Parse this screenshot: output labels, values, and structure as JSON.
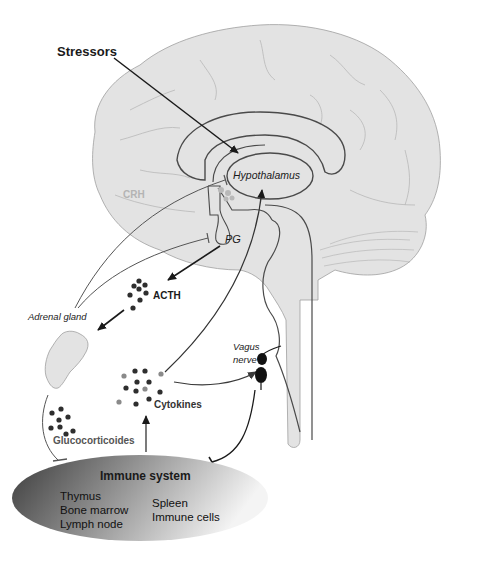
{
  "diagram": {
    "labels": {
      "stressors": "Stressors",
      "hypothalamus": "Hypothalamus",
      "crh": "CRH",
      "pg": "PG",
      "acth": "ACTH",
      "adrenal_gland": "Adrenal gland",
      "vagus_nerve_line1": "Vagus",
      "vagus_nerve_line2": "nerve",
      "cytokines": "Cytokines",
      "glucocorticoides": "Glucocorticoides"
    },
    "immune_system": {
      "title": "Immune system",
      "column1": [
        "Thymus",
        "Bone marrow",
        "Lymph node"
      ],
      "column2": [
        "Spleen",
        "Immune cells"
      ]
    },
    "colors": {
      "brain_fill": "#e3e3e3",
      "brain_outline": "#9a9a9a",
      "structure_line": "#4a4a4a",
      "arrow": "#1a1a1a",
      "dot_dark": "#2e2e2e",
      "dot_light": "#8a8a8a",
      "crh_text": "#b4b4b4",
      "immune_dark": "#3a3a3a",
      "immune_light": "#f2f2f2"
    },
    "relations": [
      {
        "from": "Stressors",
        "to": "Hypothalamus",
        "type": "stimulate"
      },
      {
        "from": "Hypothalamus",
        "to": "PG",
        "via": "CRH",
        "type": "stimulate"
      },
      {
        "from": "PG",
        "to": "ACTH",
        "type": "release"
      },
      {
        "from": "ACTH",
        "to": "Adrenal gland",
        "type": "stimulate"
      },
      {
        "from": "Adrenal gland",
        "to": "Hypothalamus",
        "type": "inhibit"
      },
      {
        "from": "Adrenal gland",
        "to": "PG",
        "type": "inhibit"
      },
      {
        "from": "Adrenal gland",
        "to": "Immune system",
        "via": "Glucocorticoides",
        "type": "inhibit"
      },
      {
        "from": "Immune system",
        "to": "Cytokines",
        "type": "release"
      },
      {
        "from": "Cytokines",
        "to": "Hypothalamus",
        "type": "stimulate"
      },
      {
        "from": "Cytokines",
        "to": "Vagus nerve",
        "type": "stimulate"
      },
      {
        "from": "Vagus nerve",
        "to": "Immune system",
        "type": "inhibit"
      }
    ]
  }
}
